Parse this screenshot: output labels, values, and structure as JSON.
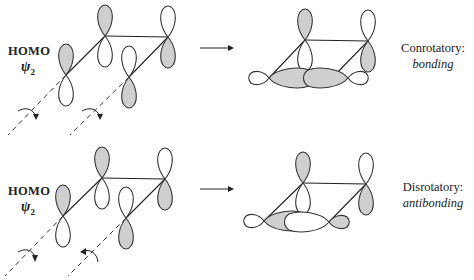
{
  "top_partial_text": "...ry motion, on",
  "panels": [
    {
      "id": "conrotatory",
      "orbital_label": "HOMO",
      "wavefunction": "ψ",
      "wavefunction_subscript": "2",
      "mode_label": "Conrotatory:",
      "result_label": "bonding",
      "rotation": "both clockwise",
      "reactant_lobes_shaded": [
        "C1-top",
        "C2-top",
        "C3-bottom",
        "C4-bottom"
      ],
      "product_sigma": "in-phase (both shaded inner lobes)"
    },
    {
      "id": "disrotatory",
      "orbital_label": "HOMO",
      "wavefunction": "ψ",
      "wavefunction_subscript": "2",
      "mode_label": "Disrotatory:",
      "result_label": "antibonding",
      "rotation": "one clockwise, one counterclockwise",
      "reactant_lobes_shaded": [
        "C1-top",
        "C2-top",
        "C3-bottom",
        "C4-bottom"
      ],
      "product_sigma": "out-of-phase (shaded and white inner lobes)"
    }
  ],
  "icons": {
    "reaction_arrow": "right-arrow-icon",
    "rotation_arrow": "curved-rotation-arrow-icon"
  }
}
